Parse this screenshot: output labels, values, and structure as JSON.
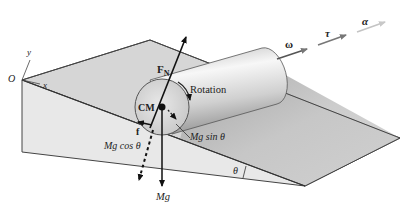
{
  "figure": {
    "labels": {
      "origin": "O",
      "x_axis": "x",
      "y_axis": "y",
      "normal_force": "F",
      "normal_force_sub": "N",
      "rotation": "Rotation",
      "center_of_mass": "CM",
      "friction": "f",
      "weight_perp": "Mg cos θ",
      "weight_parallel": "Mg sin θ",
      "weight": "Mg",
      "angle": "θ",
      "angular_velocity": "ω",
      "torque": "τ",
      "angular_acceleration": "α"
    },
    "colors": {
      "incline_top": "#d9d9d9",
      "incline_front": "#e6e6e6",
      "plane_right": "#bdbdbd",
      "cylinder_light": "#f4f4f4",
      "cylinder_dark": "#a8a8a8",
      "arrow_dark": "#111111",
      "vector_grey": "#7a7a7a"
    }
  }
}
